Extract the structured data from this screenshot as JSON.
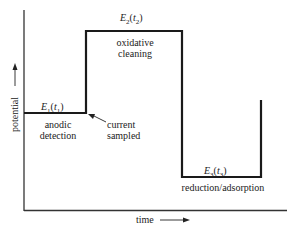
{
  "diagram": {
    "type": "pulsed amperometric waveform",
    "axes": {
      "y_label": "potential",
      "x_label": "time"
    },
    "steps": [
      {
        "potential_label": "E1(t1)",
        "description_lines": [
          "anodic",
          "detection"
        ]
      },
      {
        "potential_label": "E2(t2)",
        "description_lines": [
          "oxidative",
          "cleaning"
        ]
      },
      {
        "potential_label": "E3(t3)",
        "description_lines": [
          "reduction/adsorption"
        ]
      }
    ],
    "annotation": {
      "lines": [
        "current",
        "sampled"
      ]
    }
  },
  "labels": {
    "e1": "E",
    "e1_sub": "1",
    "t1": "t",
    "t1_sub": "1",
    "e2": "E",
    "e2_sub": "2",
    "t2": "t",
    "t2_sub": "2",
    "e3": "E",
    "e3_sub": "3",
    "t3": "t",
    "t3_sub": "3",
    "step1_line1": "anodic",
    "step1_line2": "detection",
    "step2_line1": "oxidative",
    "step2_line2": "cleaning",
    "step3_line1": "reduction/adsorption",
    "current_line1": "current",
    "current_line2": "sampled",
    "y_axis": "potential",
    "x_axis": "time"
  },
  "colors": {
    "line": "#1a1a1a",
    "background": "#ffffff"
  }
}
